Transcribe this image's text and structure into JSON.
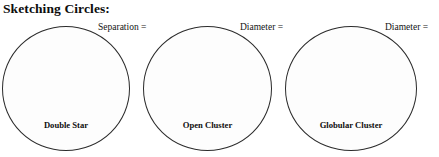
{
  "worksheet": {
    "title": "Sketching Circles:",
    "sketches": [
      {
        "id": "double-star",
        "caption": "Double Star",
        "measure_label": "Separation ="
      },
      {
        "id": "open-cluster",
        "caption": "Open Cluster",
        "measure_label": "Diameter ="
      },
      {
        "id": "globular-cluster",
        "caption": "Globular Cluster",
        "measure_label": "Diameter ="
      }
    ],
    "colors": {
      "ink": "#0d0d0d",
      "circle_stroke": "#2b2b2b",
      "circle_fill": "#fdfdfd",
      "page_background": "#ffffff"
    }
  }
}
